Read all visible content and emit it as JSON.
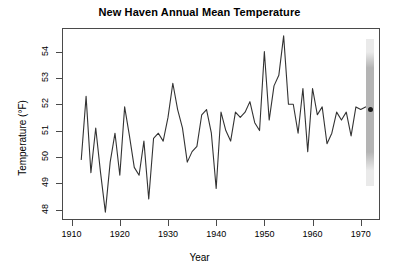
{
  "chart_data": {
    "type": "line",
    "title": "New Haven Annual Mean Temperature",
    "xlabel": "Year",
    "ylabel": "Temperature (°F)",
    "xlim": [
      1908,
      1974
    ],
    "ylim": [
      47.6,
      54.9
    ],
    "grid": false,
    "legend": "none",
    "xticks": [
      1910,
      1920,
      1930,
      1940,
      1950,
      1960,
      1970
    ],
    "xtick_labels": [
      "1910",
      "1920",
      "1930",
      "1940",
      "1950",
      "1960",
      "1970"
    ],
    "yticks": [
      48,
      49,
      50,
      51,
      52,
      53,
      54
    ],
    "ytick_labels": [
      "48",
      "49",
      "50",
      "51",
      "52",
      "53",
      "54"
    ],
    "line_color": "#333333",
    "series": [
      {
        "name": "New Haven annual mean temperature",
        "x": [
          1912,
          1913,
          1914,
          1915,
          1916,
          1917,
          1918,
          1919,
          1920,
          1921,
          1922,
          1923,
          1924,
          1925,
          1926,
          1927,
          1928,
          1929,
          1930,
          1931,
          1932,
          1933,
          1934,
          1935,
          1936,
          1937,
          1938,
          1939,
          1940,
          1941,
          1942,
          1943,
          1944,
          1945,
          1946,
          1947,
          1948,
          1949,
          1950,
          1951,
          1952,
          1953,
          1954,
          1955,
          1956,
          1957,
          1958,
          1959,
          1960,
          1961,
          1962,
          1963,
          1964,
          1965,
          1966,
          1967,
          1968,
          1969,
          1970,
          1971
        ],
        "values": [
          49.9,
          52.3,
          49.4,
          51.1,
          49.4,
          47.9,
          49.8,
          50.9,
          49.3,
          51.9,
          50.8,
          49.6,
          49.3,
          50.6,
          48.4,
          50.7,
          50.9,
          50.6,
          51.5,
          52.8,
          51.8,
          51.1,
          49.8,
          50.2,
          50.4,
          51.6,
          51.8,
          50.9,
          48.8,
          51.7,
          51.0,
          50.6,
          51.7,
          51.5,
          51.7,
          52.1,
          51.3,
          51.0,
          54.0,
          51.4,
          52.7,
          53.1,
          54.6,
          52.0,
          52.0,
          50.9,
          52.6,
          50.2,
          52.6,
          51.6,
          51.9,
          50.5,
          50.9,
          51.7,
          51.4,
          51.7,
          50.8,
          51.9,
          51.8,
          51.9
        ]
      }
    ],
    "forecast": {
      "label": "1972 point forecast",
      "x": 1972,
      "point": 51.8,
      "interval_low": 48.9,
      "interval_high": 54.5,
      "inner_low": 50.2,
      "inner_high": 53.4,
      "band_color_outer": "#eaeaea",
      "band_color_inner": "#b4b4b4",
      "point_color": "#1a1a1a"
    }
  },
  "axes": {
    "y_title": "Temperature (°F)",
    "x_title": "Year"
  }
}
